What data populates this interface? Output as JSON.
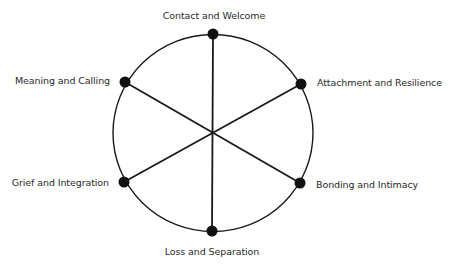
{
  "diagram": {
    "type": "radial-hexagonal-wheel",
    "nodes": [
      {
        "id": "contact",
        "label": "Contact and Welcome"
      },
      {
        "id": "attachment",
        "label": "Attachment and Resilience"
      },
      {
        "id": "bonding",
        "label": "Bonding and Intimacy"
      },
      {
        "id": "loss",
        "label": "Loss and Separation"
      },
      {
        "id": "grief",
        "label": "Grief and Integration"
      },
      {
        "id": "meaning",
        "label": "Meaning and Calling"
      }
    ],
    "spokes": [
      {
        "from": "contact",
        "to": "loss"
      },
      {
        "from": "attachment",
        "to": "grief"
      },
      {
        "from": "meaning",
        "to": "bonding"
      }
    ],
    "colors": {
      "line": "#1a1a1a",
      "node": "#111111",
      "text": "#2a2a2a",
      "background": "#ffffff"
    }
  }
}
